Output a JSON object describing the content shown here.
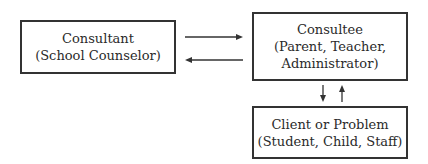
{
  "diagram": {
    "nodes": [
      {
        "id": "consultant",
        "title": "Consultant",
        "subtitle": "(School Counselor)"
      },
      {
        "id": "consultee",
        "title": "Consultee",
        "subtitle_line1": "(Parent, Teacher,",
        "subtitle_line2": "Administrator)"
      },
      {
        "id": "client",
        "title": "Client or Problem",
        "subtitle": "(Student, Child, Staff)"
      }
    ],
    "edges": [
      {
        "from": "consultant",
        "to": "consultee",
        "direction": "right"
      },
      {
        "from": "consultee",
        "to": "consultant",
        "direction": "left"
      },
      {
        "from": "consultee",
        "to": "client",
        "direction": "down"
      },
      {
        "from": "client",
        "to": "consultee",
        "direction": "up"
      }
    ],
    "colors": {
      "stroke": "#333333",
      "text": "#2a2a2a",
      "background": "#ffffff"
    }
  }
}
